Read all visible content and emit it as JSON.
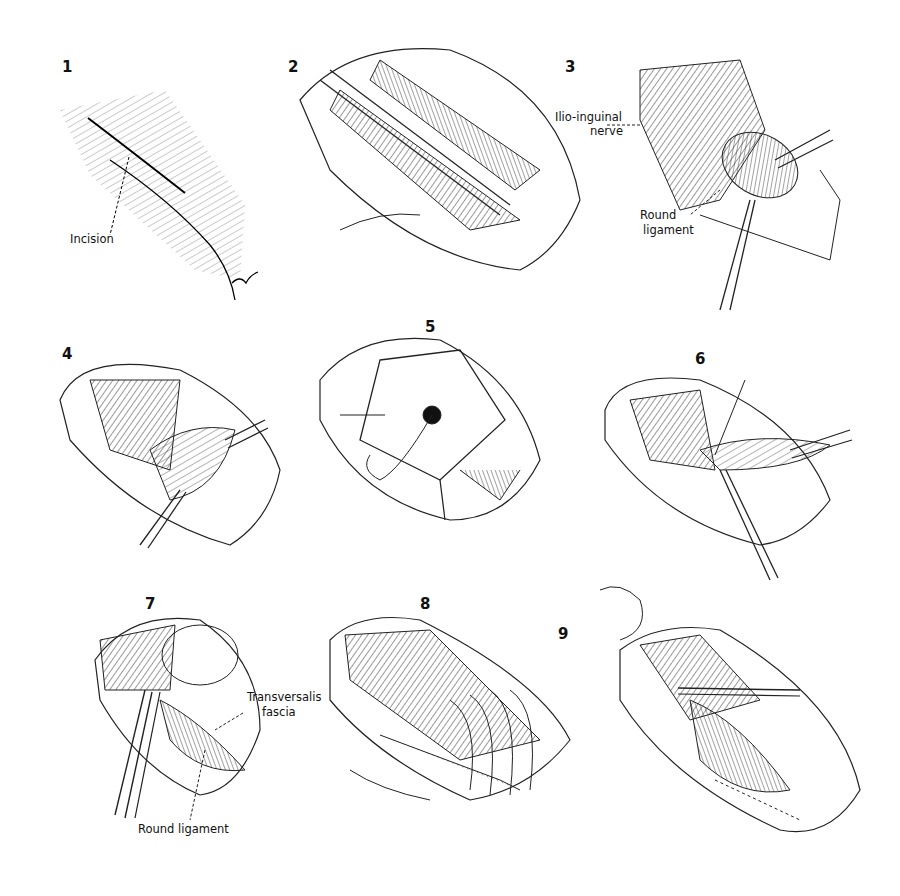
{
  "figure": {
    "panels": [
      {
        "number": "1",
        "labels": [
          "Incision"
        ]
      },
      {
        "number": "2",
        "labels": []
      },
      {
        "number": "3",
        "labels": [
          "Ilio-inguinal nerve",
          "Round ligament"
        ]
      },
      {
        "number": "4",
        "labels": []
      },
      {
        "number": "5",
        "labels": []
      },
      {
        "number": "6",
        "labels": []
      },
      {
        "number": "7",
        "labels": [
          "Transversalis fascia",
          "Round ligament"
        ]
      },
      {
        "number": "8",
        "labels": []
      },
      {
        "number": "9",
        "labels": []
      }
    ]
  },
  "labels": {
    "p1_incision": "Incision",
    "p3_nerve_l1": "Ilio-inguinal",
    "p3_nerve_l2": "nerve",
    "p3_round_l1": "Round",
    "p3_round_l2": "ligament",
    "p7_fascia_l1": "Transversalis",
    "p7_fascia_l2": "fascia",
    "p7_round": "Round ligament"
  },
  "numbers": [
    "1",
    "2",
    "3",
    "4",
    "5",
    "6",
    "7",
    "8",
    "9"
  ]
}
